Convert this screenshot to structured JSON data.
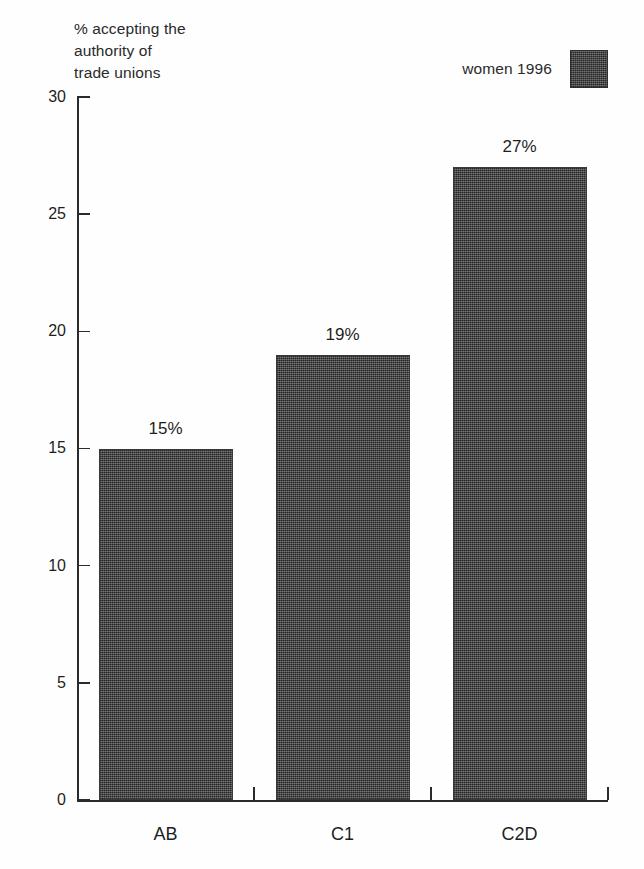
{
  "chart_data": {
    "type": "bar",
    "title": "",
    "caption": "% accepting the\nauthority of\ntrade unions",
    "categories": [
      "AB",
      "C1",
      "C2D"
    ],
    "values": [
      15,
      19,
      27
    ],
    "value_labels": [
      "15%",
      "19%",
      "27%"
    ],
    "series": [
      {
        "name": "women 1996",
        "values": [
          15,
          19,
          27
        ],
        "color": "#4d4d4d"
      }
    ],
    "xlabel": "",
    "ylabel": "% accepting the authority of trade unions",
    "ylim": [
      0,
      30
    ],
    "yticks": [
      0,
      5,
      10,
      15,
      20,
      25,
      30
    ],
    "ytick_labels": [
      "0",
      "5",
      "10",
      "15",
      "20",
      "25",
      "30"
    ],
    "grid": false,
    "legend": {
      "position": "top-right",
      "entries": [
        {
          "label": "women 1996",
          "color": "#4d4d4d"
        }
      ]
    }
  },
  "legend": {
    "label": "women 1996"
  },
  "axis": {
    "caption": "% accepting the\nauthority of\ntrade unions"
  }
}
